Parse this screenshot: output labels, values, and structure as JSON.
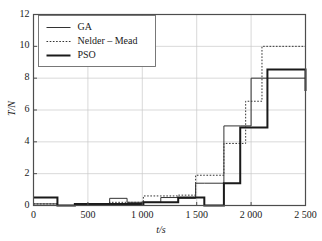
{
  "chart_data": {
    "type": "line",
    "style": "step-histogram-outline",
    "title": "",
    "xlabel": "t/s",
    "ylabel": "T/N",
    "xlim": [
      0,
      2500
    ],
    "ylim": [
      0,
      12
    ],
    "xticks": [
      0,
      500,
      1000,
      1500,
      2000,
      2500
    ],
    "xtick_labels": [
      "0",
      "500",
      "1 000",
      "1 500",
      "2 000",
      "2 500"
    ],
    "yticks": [
      0,
      2,
      4,
      6,
      8,
      10,
      12
    ],
    "ytick_labels": [
      "0",
      "2",
      "4",
      "6",
      "8",
      "10",
      "12"
    ],
    "grid": true,
    "grid_color": "#c8c8c8",
    "legend_position": "upper-left",
    "series": [
      {
        "name": "GA",
        "line_style": "solid",
        "line_width": 1,
        "color": "#333333",
        "edges": [
          0,
          220,
          380,
          540,
          700,
          860,
          1010,
          1170,
          1330,
          1490,
          1570,
          1750,
          1900,
          2000,
          2500
        ],
        "values": [
          0.1,
          0.0,
          0.0,
          0.1,
          0.45,
          0.2,
          0.2,
          0.5,
          0.45,
          1.4,
          1.4,
          5.0,
          5.0,
          8.0,
          8.0
        ]
      },
      {
        "name": "Nelder-Mead",
        "line_style": "dotted",
        "line_width": 1,
        "color": "#333333",
        "edges": [
          0,
          220,
          380,
          540,
          700,
          860,
          1010,
          1170,
          1330,
          1490,
          1570,
          1750,
          1950,
          2100,
          2500
        ],
        "values": [
          0.1,
          0.0,
          0.0,
          0.1,
          0.2,
          0.2,
          0.6,
          0.6,
          0.65,
          1.9,
          1.9,
          3.9,
          6.55,
          10.0,
          10.0
        ]
      },
      {
        "name": "PSO",
        "line_style": "solid",
        "line_width": 2,
        "color": "#1a1a1a",
        "edges": [
          0,
          220,
          380,
          700,
          860,
          1010,
          1170,
          1330,
          1490,
          1570,
          1750,
          1900,
          2100,
          2150,
          2330,
          2500
        ],
        "values": [
          0.5,
          0.0,
          0.1,
          0.1,
          0.1,
          0.2,
          0.2,
          0.5,
          0.5,
          0.0,
          1.4,
          4.9,
          4.9,
          8.55,
          8.55,
          7.2
        ]
      }
    ]
  },
  "legend": {
    "entries": [
      {
        "label": "GA"
      },
      {
        "label": "Nelder – Mead"
      },
      {
        "label": "PSO"
      }
    ]
  },
  "axes": {
    "frame_color": "#4d4d4d"
  }
}
